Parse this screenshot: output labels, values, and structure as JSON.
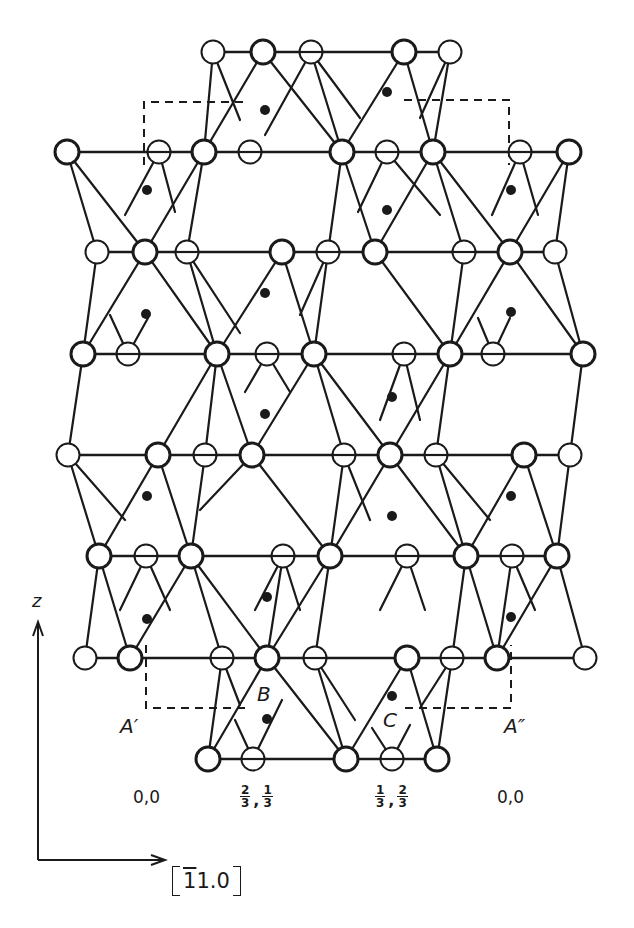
{
  "figure": {
    "colors": {
      "ink": "#1a1a1a",
      "background": "#ffffff"
    },
    "rows": [
      {
        "y": 52,
        "line": [
          213,
          450
        ],
        "atoms": [
          [
            213,
            "thin"
          ],
          [
            263,
            "bold"
          ],
          [
            311,
            "hatched"
          ],
          [
            404,
            "bold"
          ],
          [
            450,
            "thin"
          ]
        ]
      },
      {
        "y": 152,
        "line": [
          67,
          569
        ],
        "atoms": [
          [
            67,
            "bold"
          ],
          [
            159,
            "hatched"
          ],
          [
            204,
            "bold"
          ],
          [
            250,
            "hatched"
          ],
          [
            342,
            "bold"
          ],
          [
            387,
            "hatched"
          ],
          [
            433,
            "bold"
          ],
          [
            520,
            "hatched"
          ],
          [
            569,
            "bold"
          ]
        ]
      },
      {
        "y": 252,
        "line": [
          97,
          555
        ],
        "atoms": [
          [
            97,
            "thin"
          ],
          [
            145,
            "bold"
          ],
          [
            187,
            "hatched"
          ],
          [
            282,
            "bold"
          ],
          [
            328,
            "hatched"
          ],
          [
            375,
            "bold"
          ],
          [
            464,
            "hatched"
          ],
          [
            510,
            "bold"
          ],
          [
            555,
            "thin"
          ]
        ]
      },
      {
        "y": 354,
        "line": [
          83,
          583
        ],
        "atoms": [
          [
            83,
            "bold"
          ],
          [
            128,
            "hatched"
          ],
          [
            217,
            "bold"
          ],
          [
            267,
            "hatched"
          ],
          [
            314,
            "bold"
          ],
          [
            404,
            "hatched"
          ],
          [
            450,
            "bold"
          ],
          [
            493,
            "hatched"
          ],
          [
            583,
            "bold"
          ]
        ]
      },
      {
        "y": 455,
        "line": [
          68,
          570
        ],
        "atoms": [
          [
            68,
            "thin"
          ],
          [
            158,
            "bold"
          ],
          [
            205,
            "hatched"
          ],
          [
            252,
            "bold"
          ],
          [
            344,
            "hatched"
          ],
          [
            390,
            "bold"
          ],
          [
            436,
            "hatched"
          ],
          [
            524,
            "bold"
          ],
          [
            570,
            "thin"
          ]
        ]
      },
      {
        "y": 556,
        "line": [
          99,
          557
        ],
        "atoms": [
          [
            99,
            "bold"
          ],
          [
            146,
            "hatched"
          ],
          [
            191,
            "bold"
          ],
          [
            283,
            "hatched"
          ],
          [
            330,
            "bold"
          ],
          [
            407,
            "hatched"
          ],
          [
            466,
            "bold"
          ],
          [
            512,
            "hatched"
          ],
          [
            557,
            "bold"
          ]
        ]
      },
      {
        "y": 658,
        "line": [
          85,
          585
        ],
        "atoms": [
          [
            85,
            "thin"
          ],
          [
            130,
            "bold"
          ],
          [
            222,
            "hatched"
          ],
          [
            267,
            "bold"
          ],
          [
            315,
            "hatched"
          ],
          [
            407,
            "bold"
          ],
          [
            452,
            "hatched"
          ],
          [
            497,
            "bold"
          ],
          [
            585,
            "thin"
          ]
        ]
      },
      {
        "y": 759,
        "line": [
          208,
          437
        ],
        "atoms": [
          [
            208,
            "bold"
          ],
          [
            253,
            "hatched"
          ],
          [
            346,
            "bold"
          ],
          [
            392,
            "hatched"
          ],
          [
            437,
            "bold"
          ]
        ]
      }
    ],
    "bonds": [
      [
        213,
        52,
        204,
        152
      ],
      [
        213,
        52,
        240,
        120
      ],
      [
        263,
        52,
        204,
        152
      ],
      [
        263,
        52,
        342,
        152
      ],
      [
        311,
        52,
        342,
        152
      ],
      [
        311,
        52,
        265,
        135
      ],
      [
        311,
        52,
        360,
        118
      ],
      [
        404,
        52,
        342,
        152
      ],
      [
        404,
        52,
        433,
        152
      ],
      [
        450,
        52,
        433,
        152
      ],
      [
        450,
        52,
        420,
        118
      ],
      [
        67,
        152,
        145,
        252
      ],
      [
        67,
        152,
        97,
        252
      ],
      [
        204,
        152,
        145,
        252
      ],
      [
        204,
        152,
        187,
        252
      ],
      [
        159,
        152,
        125,
        215
      ],
      [
        159,
        152,
        175,
        212
      ],
      [
        342,
        152,
        375,
        252
      ],
      [
        342,
        152,
        328,
        252
      ],
      [
        387,
        152,
        440,
        215
      ],
      [
        387,
        152,
        358,
        212
      ],
      [
        433,
        152,
        375,
        252
      ],
      [
        433,
        152,
        510,
        252
      ],
      [
        433,
        152,
        464,
        252
      ],
      [
        520,
        152,
        492,
        215
      ],
      [
        520,
        152,
        538,
        215
      ],
      [
        569,
        152,
        510,
        252
      ],
      [
        569,
        152,
        555,
        252
      ],
      [
        97,
        252,
        83,
        354
      ],
      [
        145,
        252,
        217,
        354
      ],
      [
        145,
        252,
        83,
        354
      ],
      [
        187,
        252,
        217,
        354
      ],
      [
        187,
        252,
        240,
        333
      ],
      [
        282,
        252,
        217,
        354
      ],
      [
        282,
        252,
        314,
        354
      ],
      [
        328,
        252,
        314,
        354
      ],
      [
        328,
        252,
        300,
        315
      ],
      [
        375,
        252,
        450,
        354
      ],
      [
        464,
        252,
        450,
        354
      ],
      [
        510,
        252,
        450,
        354
      ],
      [
        510,
        252,
        583,
        354
      ],
      [
        555,
        252,
        583,
        354
      ],
      [
        128,
        354,
        110,
        315
      ],
      [
        128,
        354,
        148,
        318
      ],
      [
        267,
        354,
        245,
        392
      ],
      [
        267,
        354,
        290,
        392
      ],
      [
        404,
        354,
        380,
        420
      ],
      [
        404,
        354,
        420,
        420
      ],
      [
        493,
        354,
        478,
        318
      ],
      [
        493,
        354,
        510,
        318
      ],
      [
        83,
        354,
        68,
        455
      ],
      [
        217,
        354,
        158,
        455
      ],
      [
        217,
        354,
        252,
        455
      ],
      [
        314,
        354,
        252,
        455
      ],
      [
        314,
        354,
        390,
        455
      ],
      [
        314,
        354,
        344,
        455
      ],
      [
        450,
        354,
        390,
        455
      ],
      [
        450,
        354,
        436,
        455
      ],
      [
        583,
        354,
        570,
        455
      ],
      [
        217,
        354,
        205,
        455
      ],
      [
        68,
        455,
        99,
        556
      ],
      [
        68,
        455,
        125,
        520
      ],
      [
        158,
        455,
        99,
        556
      ],
      [
        158,
        455,
        191,
        556
      ],
      [
        205,
        455,
        191,
        556
      ],
      [
        252,
        455,
        330,
        556
      ],
      [
        252,
        455,
        200,
        510
      ],
      [
        344,
        455,
        330,
        556
      ],
      [
        344,
        455,
        370,
        520
      ],
      [
        390,
        455,
        330,
        556
      ],
      [
        390,
        455,
        466,
        556
      ],
      [
        436,
        455,
        466,
        556
      ],
      [
        436,
        455,
        490,
        520
      ],
      [
        524,
        455,
        466,
        556
      ],
      [
        524,
        455,
        557,
        556
      ],
      [
        570,
        455,
        557,
        556
      ],
      [
        99,
        556,
        85,
        658
      ],
      [
        99,
        556,
        130,
        658
      ],
      [
        146,
        556,
        120,
        610
      ],
      [
        146,
        556,
        170,
        610
      ],
      [
        191,
        556,
        130,
        658
      ],
      [
        191,
        556,
        222,
        658
      ],
      [
        191,
        556,
        267,
        658
      ],
      [
        283,
        556,
        267,
        658
      ],
      [
        283,
        556,
        255,
        610
      ],
      [
        283,
        556,
        300,
        610
      ],
      [
        330,
        556,
        267,
        658
      ],
      [
        330,
        556,
        315,
        658
      ],
      [
        407,
        556,
        380,
        610
      ],
      [
        407,
        556,
        425,
        610
      ],
      [
        466,
        556,
        497,
        658
      ],
      [
        466,
        556,
        452,
        658
      ],
      [
        512,
        556,
        497,
        658
      ],
      [
        512,
        556,
        535,
        610
      ],
      [
        557,
        556,
        497,
        658
      ],
      [
        557,
        556,
        585,
        658
      ],
      [
        222,
        658,
        208,
        759
      ],
      [
        222,
        658,
        240,
        705
      ],
      [
        267,
        658,
        208,
        759
      ],
      [
        267,
        658,
        346,
        759
      ],
      [
        315,
        658,
        346,
        759
      ],
      [
        315,
        658,
        355,
        720
      ],
      [
        407,
        658,
        346,
        759
      ],
      [
        407,
        658,
        437,
        759
      ],
      [
        452,
        658,
        437,
        759
      ],
      [
        452,
        658,
        420,
        708
      ],
      [
        253,
        759,
        235,
        720
      ],
      [
        253,
        759,
        282,
        700
      ],
      [
        392,
        759,
        372,
        728
      ],
      [
        392,
        759,
        410,
        725
      ]
    ],
    "cations": [
      [
        265,
        110
      ],
      [
        387,
        92
      ],
      [
        147,
        190
      ],
      [
        387,
        210
      ],
      [
        511,
        190
      ],
      [
        265,
        293
      ],
      [
        146,
        314
      ],
      [
        511,
        312
      ],
      [
        265,
        414
      ],
      [
        392,
        397
      ],
      [
        147,
        496
      ],
      [
        392,
        516
      ],
      [
        511,
        496
      ],
      [
        267,
        597
      ],
      [
        147,
        619
      ],
      [
        511,
        617
      ],
      [
        267,
        719
      ],
      [
        392,
        696
      ]
    ],
    "cell_outline_top": {
      "path": "M144,165 L144,102 L245,102 M404,100 L509,100 L509,165"
    },
    "cell_outline_bottom": {
      "path": "M146,645 L146,708 L250,708 M405,708 L511,708 L511,645"
    },
    "labels": {
      "A_prime": "A′",
      "A_double_prime": "A″",
      "B": "B",
      "C": "C",
      "pos_left": "0,0",
      "pos_right": "0,0",
      "pos_B": {
        "n1": "2",
        "d1": "3",
        "n2": "1",
        "d2": "3"
      },
      "pos_C": {
        "n1": "1",
        "d1": "3",
        "n2": "2",
        "d2": "3"
      },
      "axis_z": "z",
      "axis_dir_bar": "1",
      "axis_dir_rest": "1.0"
    }
  }
}
